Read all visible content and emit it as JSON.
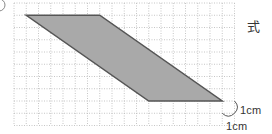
{
  "problem": {
    "marker_shape": "circle-number-marker",
    "formula_label": "式"
  },
  "grid": {
    "origin_x": 14,
    "origin_y": 3,
    "cell_size": 12.25,
    "columns": 18,
    "rows": 10,
    "line_color": "#b8b8b8",
    "line_style": "dotted"
  },
  "shape": {
    "type": "parallelogram",
    "fill": "#a9a9a9",
    "stroke": "#555555",
    "vertices_grid": [
      [
        1,
        1
      ],
      [
        7,
        1
      ],
      [
        17,
        8
      ],
      [
        11,
        8
      ]
    ]
  },
  "scale": {
    "horizontal_label": "1cm",
    "vertical_label": "1cm"
  }
}
